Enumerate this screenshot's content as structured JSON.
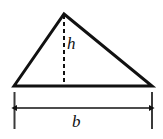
{
  "figure": {
    "name": "triangle-area-diagram",
    "type": "geometry-diagram",
    "background_color": "#ffffff",
    "stroke_color": "#111111",
    "labels": {
      "height": "h",
      "base": "b"
    },
    "triangle": {
      "apex": {
        "x": 64,
        "y": 14
      },
      "bottom_left": {
        "x": 14,
        "y": 86
      },
      "bottom_right": {
        "x": 152,
        "y": 86
      },
      "stroke_width": 3
    },
    "height_line": {
      "from": {
        "x": 64,
        "y": 15
      },
      "to": {
        "x": 64,
        "y": 86
      },
      "style": "dashed",
      "dash_pattern": "4,3",
      "stroke_width": 2
    },
    "dimension": {
      "axis_y": 108,
      "left_tick_x": 14,
      "right_tick_x": 152,
      "tick_top_y": 92,
      "tick_bottom_y": 129,
      "tick_stroke_width": 2,
      "arrow_stroke_width": 1.6,
      "arrowheads": "both"
    }
  }
}
